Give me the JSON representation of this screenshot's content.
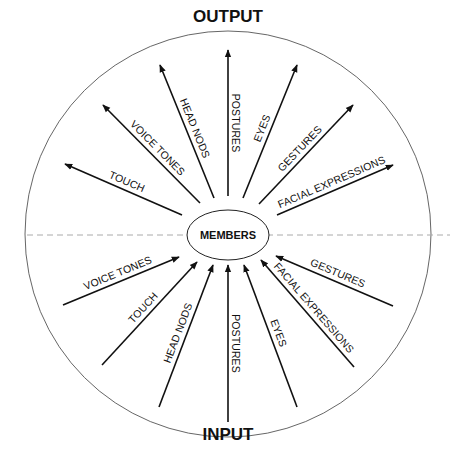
{
  "diagram": {
    "top_title": "OUTPUT",
    "bottom_title": "INPUT",
    "center_label": "MEMBERS",
    "colors": {
      "line": "#111111",
      "circle": "#555555",
      "dash": "#aaaaaa",
      "background": "#ffffff"
    },
    "output_arrows": [
      {
        "label": "TOUCH",
        "x1": 182,
        "y1": 215,
        "x2": 65,
        "y2": 164
      },
      {
        "label": "VOICE TONES",
        "x1": 200,
        "y1": 203,
        "x2": 103,
        "y2": 105
      },
      {
        "label": "HEAD NODS",
        "x1": 214,
        "y1": 198,
        "x2": 160,
        "y2": 65
      },
      {
        "label": "POSTURES",
        "x1": 228,
        "y1": 196,
        "x2": 228,
        "y2": 50
      },
      {
        "label": "EYES",
        "x1": 243,
        "y1": 198,
        "x2": 297,
        "y2": 65
      },
      {
        "label": "GESTURES",
        "x1": 259,
        "y1": 204,
        "x2": 353,
        "y2": 105
      },
      {
        "label": "FACIAL EXPRESSIONS",
        "x1": 277,
        "y1": 215,
        "x2": 393,
        "y2": 165
      }
    ],
    "input_arrows": [
      {
        "label": "VOICE TONES",
        "x1": 63,
        "y1": 305,
        "x2": 179,
        "y2": 257
      },
      {
        "label": "TOUCH",
        "x1": 102,
        "y1": 365,
        "x2": 197,
        "y2": 262
      },
      {
        "label": "HEAD NODS",
        "x1": 159,
        "y1": 407,
        "x2": 213,
        "y2": 265
      },
      {
        "label": "POSTURES",
        "x1": 228,
        "y1": 422,
        "x2": 228,
        "y2": 265
      },
      {
        "label": "EYES",
        "x1": 297,
        "y1": 407,
        "x2": 244,
        "y2": 265
      },
      {
        "label": "FACIAL EXPRESSIONS",
        "x1": 354,
        "y1": 367,
        "x2": 261,
        "y2": 260
      },
      {
        "label": "GESTURES",
        "x1": 393,
        "y1": 306,
        "x2": 276,
        "y2": 256
      }
    ]
  }
}
